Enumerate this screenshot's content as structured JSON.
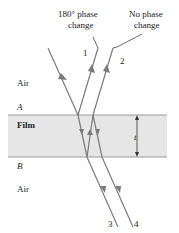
{
  "labels": {
    "top_left_caption_line1": "180° phase",
    "top_left_caption_line2": "change",
    "top_right_caption_line1": "No phase",
    "top_right_caption_line2": "change",
    "ray1": "1",
    "ray2": "2",
    "ray3": "3",
    "ray4": "4",
    "air_top": "Air",
    "interface_a": "A",
    "film": "Film",
    "thickness": "t",
    "interface_b": "B",
    "air_bottom": "Air"
  },
  "colors": {
    "film_fill": "#e6e6e6",
    "film_border": "#9a9a9a",
    "ray": "#7a7a7a",
    "text": "#222222"
  }
}
